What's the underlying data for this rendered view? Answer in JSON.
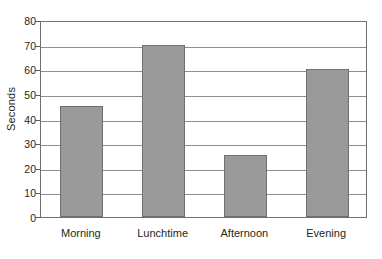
{
  "chart_data": {
    "type": "bar",
    "title": "",
    "xlabel": "",
    "ylabel": "Seconds",
    "categories": [
      "Morning",
      "Lunchtime",
      "Afternoon",
      "Evening"
    ],
    "values": [
      45,
      70,
      25,
      60
    ],
    "ylim": [
      0,
      80
    ],
    "ytick_values": [
      0,
      10,
      20,
      30,
      40,
      50,
      60,
      70,
      80
    ],
    "ytick_labels": [
      "0",
      "10",
      "20",
      "30",
      "40",
      "50",
      "60",
      "70",
      "80"
    ],
    "grid": true,
    "grid_axis": "y",
    "legend": false,
    "legend_position": "none",
    "bar_color": "#9a9a9a",
    "bar_border_color": "#6f6f6f",
    "gridline_color": "#8c8f92",
    "axis_border_color": "#6d7073",
    "background_color": "#ffffff",
    "text_color": "#231f20"
  }
}
